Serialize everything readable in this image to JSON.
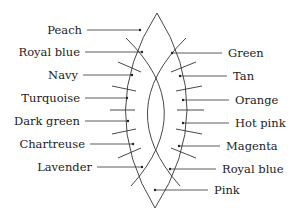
{
  "diagram": {
    "left_labels": [
      {
        "text": "Peach",
        "y": 30,
        "text_x": 82,
        "dot_x": 140
      },
      {
        "text": "Royal blue",
        "y": 52,
        "text_x": 80,
        "dot_x": 142
      },
      {
        "text": "Navy",
        "y": 75,
        "text_x": 78,
        "dot_x": 132
      },
      {
        "text": "Turquoise",
        "y": 98,
        "text_x": 80,
        "dot_x": 127
      },
      {
        "text": "Dark green",
        "y": 121,
        "text_x": 80,
        "dot_x": 128
      },
      {
        "text": "Chartreuse",
        "y": 144,
        "text_x": 85,
        "dot_x": 133
      },
      {
        "text": "Lavender",
        "y": 167,
        "text_x": 92,
        "dot_x": 142
      }
    ],
    "right_labels": [
      {
        "text": "Green",
        "y": 53,
        "text_x": 228,
        "dot_x": 172
      },
      {
        "text": "Tan",
        "y": 76,
        "text_x": 233,
        "dot_x": 180
      },
      {
        "text": "Orange",
        "y": 100,
        "text_x": 235,
        "dot_x": 183
      },
      {
        "text": "Hot pink",
        "y": 123,
        "text_x": 235,
        "dot_x": 183
      },
      {
        "text": "Magenta",
        "y": 146,
        "text_x": 226,
        "dot_x": 179
      },
      {
        "text": "Royal blue",
        "y": 169,
        "text_x": 222,
        "dot_x": 170
      },
      {
        "text": "Pink",
        "y": 190,
        "text_x": 214,
        "dot_x": 155
      }
    ],
    "colors": {
      "line": "#333333",
      "text": "#222222",
      "background": "#ffffff"
    }
  }
}
